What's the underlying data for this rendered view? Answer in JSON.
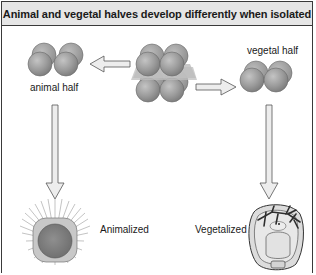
{
  "diagram": {
    "title": "Animal and vegetal halves develop differently when isolated",
    "labels": {
      "animal_half": "animal half",
      "vegetal_half": "vegetal half",
      "animalized": "Animalized",
      "vegetalized": "Vegetalized"
    },
    "nodes": [
      {
        "id": "embryo-8-cell",
        "type": "cell-cluster",
        "cells": 8,
        "note": "divided by equatorial plane"
      },
      {
        "id": "animal-half",
        "type": "cell-cluster",
        "cells": 4,
        "label": "animal half"
      },
      {
        "id": "vegetal-half",
        "type": "cell-cluster",
        "cells": 4,
        "label": "vegetal half"
      },
      {
        "id": "animalized-larva",
        "type": "larva",
        "label": "Animalized"
      },
      {
        "id": "vegetalized-larva",
        "type": "larva",
        "label": "Vegetalized"
      }
    ],
    "edges": [
      {
        "from": "embryo-8-cell",
        "to": "animal-half",
        "direction": "left"
      },
      {
        "from": "embryo-8-cell",
        "to": "vegetal-half",
        "direction": "right"
      },
      {
        "from": "animal-half",
        "to": "animalized-larva",
        "direction": "down"
      },
      {
        "from": "vegetal-half",
        "to": "vegetalized-larva",
        "direction": "down"
      }
    ],
    "colors": {
      "header_bg": "#e6e6e6",
      "cell_fill": "#9a9a9a",
      "plane": "#b8b8b8",
      "arrow_fill": "#ededed",
      "border": "#3a3a3a"
    }
  }
}
